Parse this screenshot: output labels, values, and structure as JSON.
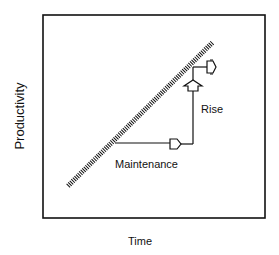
{
  "diagram": {
    "x_axis_label": "Time",
    "y_axis_label": "Productivity",
    "annotations": {
      "maintenance": "Maintenance",
      "rise": "Rise"
    },
    "elements": {
      "trend_line": "hatched diagonal line (rising productivity over time)",
      "maintenance_path": "horizontal step with right-pointing arrow",
      "rise_path": "vertical step with upward arrow then right-pointing arrow"
    }
  }
}
